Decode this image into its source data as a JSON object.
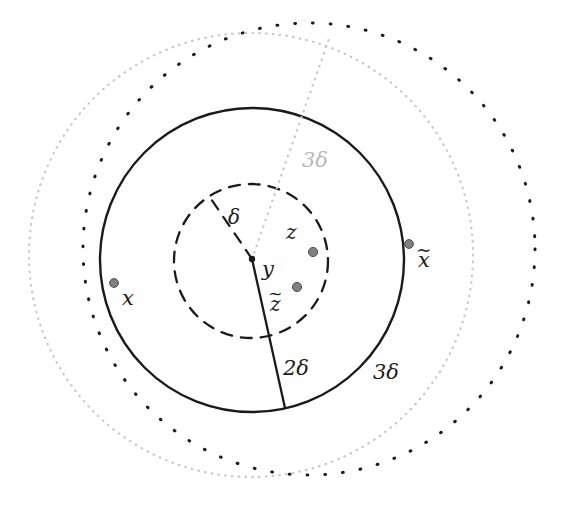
{
  "figure": {
    "background_color": "#ffffff",
    "width": 561,
    "height": 509
  },
  "labels": {
    "x": "x",
    "x_tilde_base": "x",
    "x_tilde_accent": "~",
    "y": "y",
    "z": "z",
    "z_tilde_base": "z",
    "z_tilde_accent": "~",
    "delta": "δ",
    "two_delta": "2δ",
    "three_delta_outer": "3δ",
    "three_delta_inner": "3δ"
  },
  "colors": {
    "ink": "#1a1a1a",
    "gray_label": "#b8b8b8",
    "gray_dotted": "#c8c8c8",
    "point_fill": "#808080",
    "point_stroke": "#4d4d4d",
    "black_dotted": "#1a1a1a"
  },
  "geometry": {
    "center_y": {
      "cx": 252,
      "cy": 259,
      "r": 3.2,
      "name": "center point y"
    },
    "circles": [
      {
        "name": "delta-ball",
        "label": "δ",
        "style": "dashed",
        "cx": 251,
        "cy": 261,
        "r": 77,
        "stroke": "#1a1a1a",
        "stroke_width": 2.3,
        "dash": "11 9"
      },
      {
        "name": "two-delta-ball",
        "label": "2δ",
        "style": "solid",
        "cx": 252,
        "cy": 260,
        "r": 152,
        "stroke": "#1a1a1a",
        "stroke_width": 2.4,
        "dash": ""
      },
      {
        "name": "three-delta-ball-y",
        "label": "3δ",
        "style": "dotted-fine-gray",
        "cx": 251,
        "cy": 255,
        "r": 222,
        "stroke": "#c8c8c8",
        "stroke_width": 2.2,
        "dash": "0.6 6.2"
      },
      {
        "name": "three-delta-ball-z",
        "label": "3δ",
        "style": "dotted-coarse-black",
        "cx": 309,
        "cy": 249,
        "r": 226,
        "stroke": "#1a1a1a",
        "stroke_width": 3.0,
        "dash": "0.8 17"
      }
    ],
    "radius_lines": [
      {
        "name": "two-delta-radius",
        "label": "2δ",
        "style": "solid",
        "x1": 252,
        "y1": 259,
        "x2": 285,
        "y2": 408,
        "stroke": "#1a1a1a",
        "stroke_width": 2.3
      },
      {
        "name": "delta-radius",
        "label": "δ",
        "style": "dashed",
        "x1": 252,
        "y1": 259,
        "x2": 209,
        "y2": 196,
        "stroke": "#1a1a1a",
        "stroke_width": 2.2
      },
      {
        "name": "three-delta-radius",
        "label": "3δ",
        "style": "dotted-fine-gray",
        "x1": 252,
        "y1": 259,
        "x2": 330,
        "y2": 36,
        "stroke": "#c8c8c8",
        "stroke_width": 2.2
      }
    ],
    "points": [
      {
        "name": "point-x",
        "label": "x",
        "cx": 114,
        "cy": 283,
        "r": 4.4
      },
      {
        "name": "point-x-tilde",
        "label": "x̃",
        "cx": 409,
        "cy": 244,
        "r": 4.4
      },
      {
        "name": "point-z",
        "label": "z",
        "cx": 313,
        "cy": 252,
        "r": 4.6
      },
      {
        "name": "point-z-tilde",
        "label": "z̃",
        "cx": 297,
        "cy": 287,
        "r": 4.6
      }
    ]
  }
}
